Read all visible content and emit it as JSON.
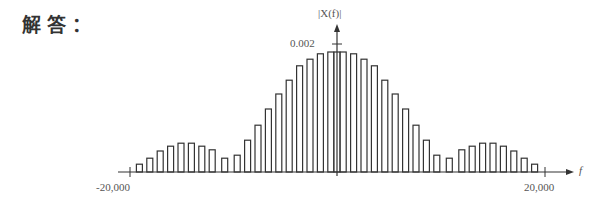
{
  "heading": "解答：",
  "chart_data": {
    "type": "bar",
    "title": "",
    "ylabel": "|X(f)|",
    "xlabel": "f",
    "x_tick_labels": [
      "-20,000",
      "20,000"
    ],
    "y_tick_labels": [
      "0.002"
    ],
    "xlim": [
      -20000,
      20000
    ],
    "ylim": [
      0,
      0.002
    ],
    "grid": false,
    "legend": null,
    "note": "Line spectrum: central sinc-like main lobe with two symmetric side lobes; values estimated from bar heights relative to 0.002 label",
    "x": [
      -19000,
      -18000,
      -17000,
      -16000,
      -15000,
      -14000,
      -13000,
      -12000,
      -10800,
      -9600,
      -8600,
      -7600,
      -6600,
      -5600,
      -4600,
      -3600,
      -2600,
      -1600,
      -600,
      0,
      600,
      1600,
      2600,
      3600,
      4600,
      5600,
      6600,
      7600,
      8600,
      9600,
      10800,
      12000,
      13000,
      14000,
      15000,
      16000,
      17000,
      18000,
      19000
    ],
    "values": [
      0.00013,
      0.00023,
      0.00035,
      0.00043,
      0.00048,
      0.00048,
      0.00043,
      0.00037,
      0.00023,
      0.00028,
      0.00053,
      0.00078,
      0.00105,
      0.0013,
      0.00153,
      0.00177,
      0.00188,
      0.00197,
      0.002,
      0.002,
      0.002,
      0.00197,
      0.00188,
      0.00177,
      0.00153,
      0.0013,
      0.00105,
      0.00078,
      0.00053,
      0.00028,
      0.00023,
      0.00037,
      0.00043,
      0.00048,
      0.00048,
      0.00043,
      0.00035,
      0.00023,
      0.00013
    ]
  },
  "axes": {
    "y_label": "|X(f)|",
    "x_label": "f",
    "y_tick": "0.002",
    "x_left_tick": "-20,000",
    "x_right_tick": "20,000"
  }
}
